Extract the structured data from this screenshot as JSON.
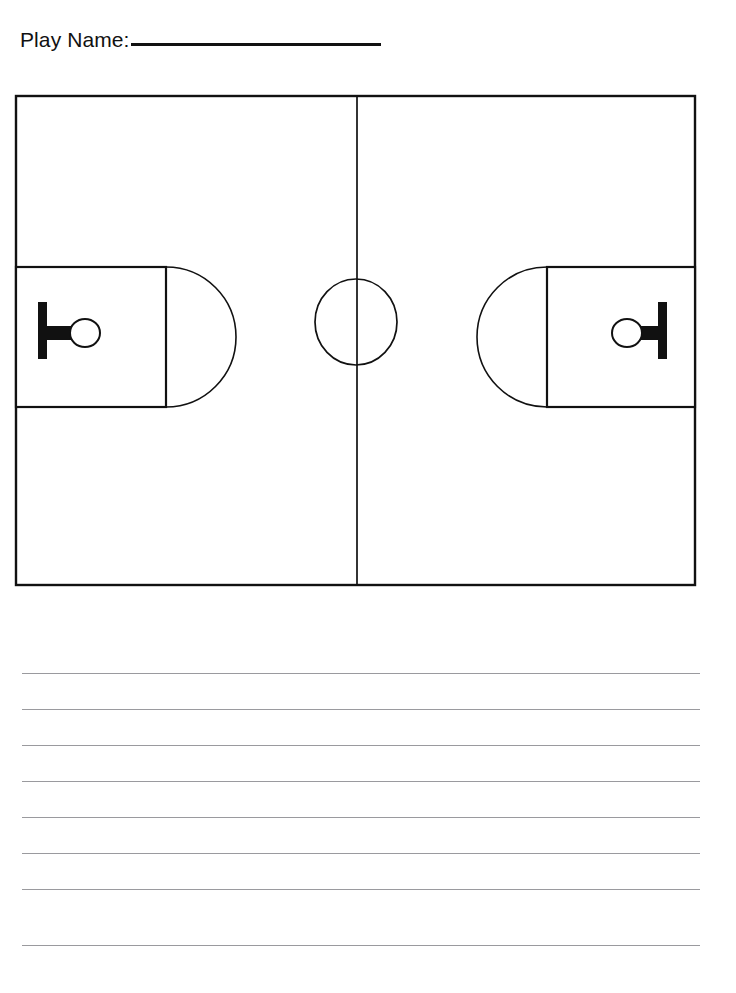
{
  "document": {
    "type": "basketball-play-worksheet",
    "orientation": "portrait",
    "background_color": "#ffffff",
    "ink_color": "#111111"
  },
  "header": {
    "label": "Play Name:",
    "blank_line": "",
    "blank_line_width_px": 250
  },
  "court": {
    "name": "basketball-court-diagram",
    "view": "full-court-horizontal",
    "line_color": "#111111",
    "fill_color": "#ffffff",
    "bounds": {
      "x": 16,
      "y": 96,
      "width": 679,
      "height": 489
    },
    "midline": {
      "x": 357,
      "y1": 96,
      "y2": 585
    },
    "center_circle": {
      "cx": 356,
      "cy": 322,
      "rx": 41,
      "ry": 43
    },
    "left_key": {
      "x": 16,
      "y": 267,
      "width": 150,
      "height": 140,
      "arc_radius": 70,
      "arc_direction": "right"
    },
    "right_key": {
      "x": 547,
      "y": 267,
      "width": 148,
      "height": 140,
      "arc_radius": 70,
      "arc_direction": "left"
    },
    "left_basket": {
      "backboard": {
        "x": 38,
        "y": 302,
        "width": 9,
        "height": 57
      },
      "stem": {
        "x": 47,
        "y": 326,
        "width": 26,
        "height": 14
      },
      "rim": {
        "cx": 85,
        "cy": 333,
        "rx": 15,
        "ry": 14
      }
    },
    "right_basket": {
      "backboard": {
        "x": 658,
        "y": 302,
        "width": 9,
        "height": 57
      },
      "stem": {
        "x": 632,
        "y": 326,
        "width": 26,
        "height": 14
      },
      "rim": {
        "cx": 627,
        "cy": 333,
        "rx": 15,
        "ry": 14
      }
    }
  },
  "notes": {
    "name": "ruled-writing-lines",
    "line_color": "#9a9a9e",
    "line_count": 8,
    "left_x": 22,
    "right_x": 700,
    "spacing_px": 36,
    "lines": [
      {
        "y": 33
      },
      {
        "y": 69
      },
      {
        "y": 105
      },
      {
        "y": 141
      },
      {
        "y": 177
      },
      {
        "y": 213
      },
      {
        "y": 249
      },
      {
        "y": 305
      }
    ]
  }
}
